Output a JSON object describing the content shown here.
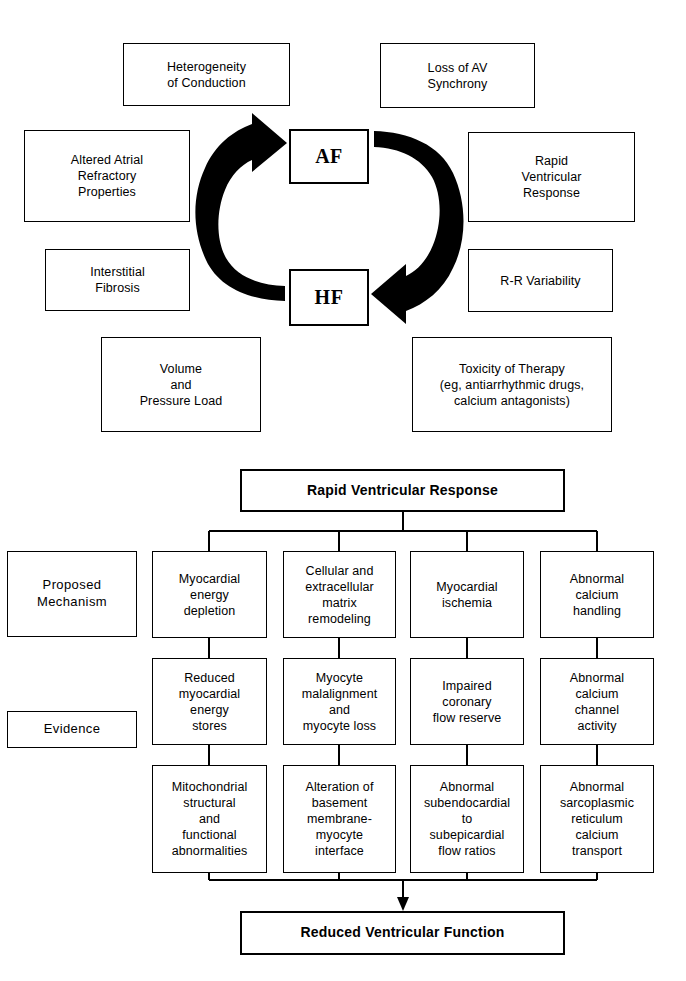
{
  "figure": {
    "panel_top": {
      "center_nodes": [
        {
          "label": "AF"
        },
        {
          "label": "HF"
        }
      ],
      "cycle_arrows": [
        {
          "name": "hf-to-af-arrow",
          "direction": "counterclockwise-up"
        },
        {
          "name": "af-to-hf-arrow",
          "direction": "clockwise-down"
        }
      ],
      "left_boxes": [
        {
          "label": "Heterogeneity\nof Conduction"
        },
        {
          "label": "Altered Atrial\nRefractory\nProperties"
        },
        {
          "label": "Interstitial\nFibrosis"
        },
        {
          "label": "Volume\nand\nPressure Load"
        }
      ],
      "right_boxes": [
        {
          "label": "Loss of AV\nSynchrony"
        },
        {
          "label": "Rapid\nVentricular\nResponse"
        },
        {
          "label": "R-R Variability"
        },
        {
          "label": "Toxicity of Therapy\n(eg, antiarrhythmic drugs,\ncalcium antagonists)"
        }
      ]
    },
    "panel_bottom": {
      "header": "Rapid Ventricular Response",
      "footer": "Reduced Ventricular Function",
      "row_labels": [
        "Proposed\nMechanism",
        "Evidence"
      ],
      "columns": [
        {
          "mechanism": "Myocardial\nenergy\ndepletion",
          "evidence_1": "Reduced\nmyocardial\nenergy\nstores",
          "evidence_2": "Mitochondrial\nstructural\nand\nfunctional\nabnormalities"
        },
        {
          "mechanism": "Cellular and\nextracellular\nmatrix\nremodeling",
          "evidence_1": "Myocyte\nmalalignment\nand\nmyocyte loss",
          "evidence_2": "Alteration of\nbasement\nmembrane-\nmyocyte\ninterface"
        },
        {
          "mechanism": "Myocardial\nischemia",
          "evidence_1": "Impaired\ncoronary\nflow reserve",
          "evidence_2": "Abnormal\nsubendocardial\nto\nsubepicardial\nflow ratios"
        },
        {
          "mechanism": "Abnormal\ncalcium\nhandling",
          "evidence_1": "Abnormal\ncalcium\nchannel\nactivity",
          "evidence_2": "Abnormal\nsarcoplasmic\nreticulum\ncalcium\ntransport"
        }
      ]
    }
  },
  "colors": {
    "ink": "#000000",
    "paper": "#ffffff"
  }
}
